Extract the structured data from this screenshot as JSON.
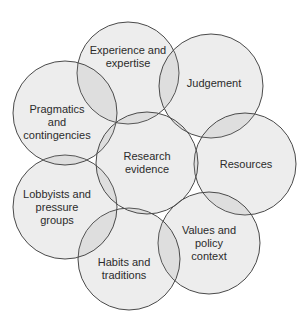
{
  "diagram": {
    "type": "overlapping-circles",
    "style": {
      "background": "#ffffff",
      "circle_fill": "#ebebeb",
      "overlap_fill": "#c9c9c9",
      "stroke": "#4a4a4a",
      "text": "#2b2b2b"
    },
    "center": {
      "label_lines": [
        "Research",
        "evidence"
      ],
      "cx": 147,
      "cy": 163,
      "r": 51
    },
    "nodes": [
      {
        "id": "experience",
        "label_lines": [
          "Experience and",
          "expertise"
        ],
        "cx": 128,
        "cy": 73,
        "r": 51,
        "lx": 128,
        "ly": 57
      },
      {
        "id": "judgement",
        "label_lines": [
          "Judgement"
        ],
        "cx": 211,
        "cy": 86,
        "r": 52,
        "lx": 214,
        "ly": 83
      },
      {
        "id": "resources",
        "label_lines": [
          "Resources"
        ],
        "cx": 245,
        "cy": 164,
        "r": 51,
        "lx": 246,
        "ly": 164
      },
      {
        "id": "values",
        "label_lines": [
          "Values and",
          "policy",
          "context"
        ],
        "cx": 209,
        "cy": 243,
        "r": 51,
        "lx": 209,
        "ly": 243
      },
      {
        "id": "habits",
        "label_lines": [
          "Habits and",
          "traditions"
        ],
        "cx": 129,
        "cy": 259,
        "r": 51,
        "lx": 124,
        "ly": 269
      },
      {
        "id": "lobbyists",
        "label_lines": [
          "Lobbyists and",
          "pressure",
          "groups"
        ],
        "cx": 65,
        "cy": 207,
        "r": 52,
        "lx": 57,
        "ly": 207
      },
      {
        "id": "pragmatics",
        "label_lines": [
          "Pragmatics",
          "and",
          "contingencies"
        ],
        "cx": 65,
        "cy": 113,
        "r": 52,
        "lx": 57,
        "ly": 122
      }
    ]
  }
}
